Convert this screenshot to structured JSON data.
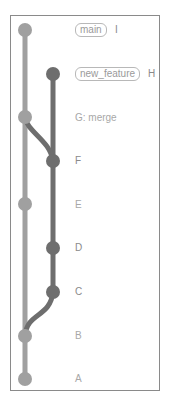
{
  "diagram": {
    "type": "git-commit-graph",
    "colors": {
      "main_branch": "#a0a0a0",
      "feature_branch": "#6e6e6e",
      "frame": "#8a8a8a",
      "label_text": "#a8a8a8"
    },
    "branches": [
      {
        "name": "main",
        "lane": 0,
        "tag_label": "main",
        "head_commit": "I"
      },
      {
        "name": "new_feature",
        "lane": 1,
        "tag_label": "new_feature",
        "head_commit": "H"
      }
    ],
    "commits": [
      {
        "id": "I",
        "label": "I",
        "lane": 0,
        "branch": "main"
      },
      {
        "id": "H",
        "label": "H",
        "lane": 1,
        "branch": "new_feature"
      },
      {
        "id": "G",
        "label": "G: merge",
        "lane": 0,
        "branch": "main"
      },
      {
        "id": "F",
        "label": "F",
        "lane": 1,
        "branch": "new_feature"
      },
      {
        "id": "E",
        "label": "E",
        "lane": 0,
        "branch": "main"
      },
      {
        "id": "D",
        "label": "D",
        "lane": 1,
        "branch": "new_feature"
      },
      {
        "id": "C",
        "label": "C",
        "lane": 1,
        "branch": "new_feature"
      },
      {
        "id": "B",
        "label": "B",
        "lane": 0,
        "branch": "main"
      },
      {
        "id": "A",
        "label": "A",
        "lane": 0,
        "branch": "main"
      }
    ],
    "edges": [
      {
        "from": "A",
        "to": "B"
      },
      {
        "from": "B",
        "to": "C",
        "type": "branch"
      },
      {
        "from": "B",
        "to": "E"
      },
      {
        "from": "C",
        "to": "D"
      },
      {
        "from": "D",
        "to": "F"
      },
      {
        "from": "E",
        "to": "G"
      },
      {
        "from": "F",
        "to": "G",
        "type": "merge"
      },
      {
        "from": "F",
        "to": "H"
      },
      {
        "from": "G",
        "to": "I"
      }
    ]
  }
}
